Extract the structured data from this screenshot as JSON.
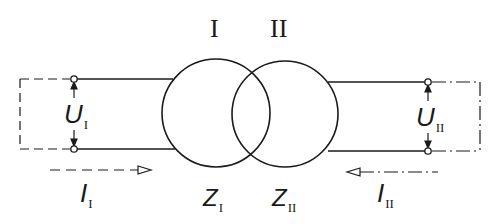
{
  "diagram": {
    "type": "two-port transformer equivalent",
    "colors": {
      "line": "#1a1a1a",
      "background": "#ffffff"
    },
    "windings": [
      {
        "id": "I",
        "label": "I",
        "impedance_label": "Z",
        "impedance_sub": "I"
      },
      {
        "id": "II",
        "label": "II",
        "impedance_label": "Z",
        "impedance_sub": "II"
      }
    ],
    "port_left": {
      "voltage_label": "U",
      "voltage_sub": "I",
      "current_label": "I",
      "current_sub": "I",
      "current_direction": "right"
    },
    "port_right": {
      "voltage_label": "U",
      "voltage_sub": "II",
      "current_label": "I",
      "current_sub": "II",
      "current_direction": "left"
    }
  }
}
